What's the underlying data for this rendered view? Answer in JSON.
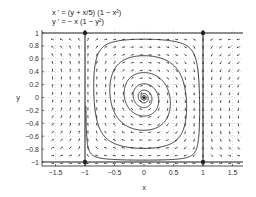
{
  "chart_data": {
    "type": "vector_field_phase_portrait",
    "title_lines": [
      "x ' = (y + x/5) (1 − x²)",
      "y ' = − x (1 − y²)"
    ],
    "xlabel": "x",
    "ylabel": "y",
    "xlim": [
      -1.6,
      1.65
    ],
    "ylim": [
      -1.1,
      1.1
    ],
    "xticks": [
      -1.5,
      -1,
      -0.5,
      0,
      0.5,
      1,
      1.5
    ],
    "xtick_labels": [
      "−1.5",
      "−1",
      "−0.5",
      "0",
      "0.5",
      "1",
      "1.5"
    ],
    "yticks": [
      1,
      0.8,
      0.6,
      0.4,
      0.2,
      0,
      -0.2,
      -0.4,
      -0.6,
      -0.8,
      -1
    ],
    "ytick_labels": [
      "1",
      "0.8",
      "0.6",
      "0.4",
      "0.2",
      "0",
      "−0.2",
      "−0.4",
      "−0.6",
      "−0.8",
      "−1"
    ],
    "grid": "dotted",
    "field": {
      "dx": "(y + x/5) * (1 - x*x)",
      "dy": "-x * (1 - y*y)"
    },
    "invariant_lines": [
      {
        "type": "vertical",
        "x": -1
      },
      {
        "type": "vertical",
        "x": 1
      },
      {
        "type": "horizontal",
        "y": 1
      },
      {
        "type": "horizontal",
        "y": -1
      }
    ],
    "equilibria": [
      {
        "x": -1,
        "y": 1
      },
      {
        "x": 1,
        "y": 1
      },
      {
        "x": -1,
        "y": -1
      },
      {
        "x": 1,
        "y": -1
      },
      {
        "x": 0,
        "y": 0
      }
    ],
    "trajectory": {
      "type": "spiral",
      "center": [
        0,
        0
      ],
      "direction": "clockwise-outward",
      "approaches": "square boundary x=±1, y=±1"
    },
    "colors": {
      "ink": "#222222",
      "grid": "#b0b0b0",
      "background": "#ffffff"
    }
  }
}
